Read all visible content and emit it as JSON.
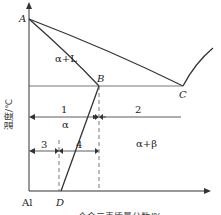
{
  "diagram": {
    "type": "binary phase diagram (Al side)",
    "axes": {
      "y_label": "温度/℃",
      "x_label": "合金元素质量分数/%",
      "origin_label": "Al"
    },
    "points": {
      "A": "A",
      "B": "B",
      "C": "C",
      "D": "D"
    },
    "regions": {
      "liquid_solid": "α+L",
      "alpha": "α",
      "alpha_beta": "α+β"
    },
    "ranges": {
      "r1": "1",
      "r2": "2",
      "r3": "3",
      "r4": "4"
    }
  }
}
